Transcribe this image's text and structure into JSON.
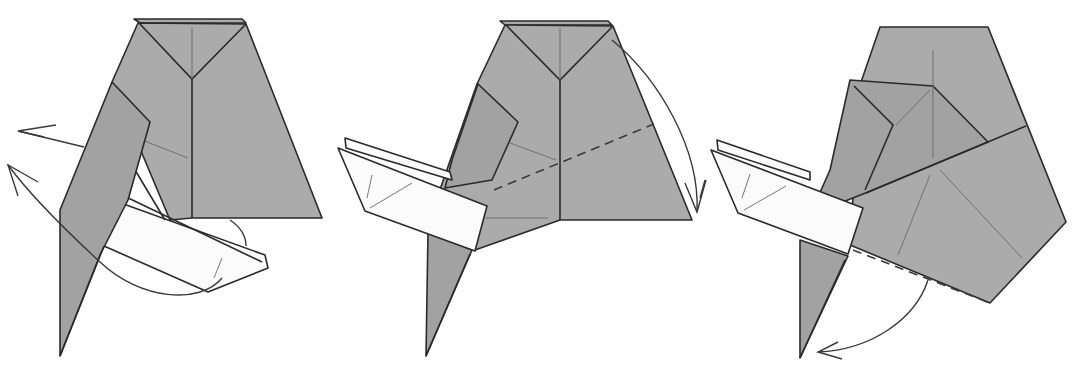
{
  "diagram": {
    "type": "origami-instructions",
    "background": "#ffffff",
    "colors": {
      "paper_colored": "#ababab",
      "paper_white": "#fbfbfb",
      "line": "#2a2a2a"
    },
    "steps": [
      {
        "index": 1,
        "name": "step-1",
        "description": "Swing flaps to the left",
        "arrows": [
          "curved arrow pointing left (upper)",
          "curved arrow pointing left (lower, from bottom white flap)"
        ],
        "fold_lines": []
      },
      {
        "index": 2,
        "name": "step-2",
        "description": "Valley fold along dashed line",
        "arrows": [
          "curved arrow pointing down along right edge"
        ],
        "fold_lines": [
          "diagonal valley-fold dashed line"
        ]
      },
      {
        "index": 3,
        "name": "step-3",
        "description": "Valley fold along bottom dashed edge",
        "arrows": [
          "curved arrow pointing down-left"
        ],
        "fold_lines": [
          "bottom-edge valley-fold dashed line"
        ]
      }
    ]
  }
}
